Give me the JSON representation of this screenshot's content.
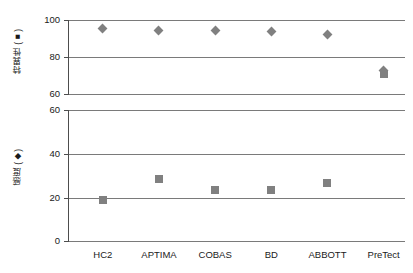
{
  "chart_data": {
    "type": "scatter",
    "title": "",
    "subtitle": "",
    "categories": [
      "HC2",
      "APTIMA",
      "COBAS",
      "BD",
      "ABBOTT",
      "PreTect"
    ],
    "panels": [
      {
        "name": "specificity-panel",
        "ylabel": "特異性 (■)",
        "ylabel_text": "特異性",
        "ylabel_marker": "square",
        "ylim": [
          60,
          100
        ],
        "yticks": [
          60,
          80,
          100
        ],
        "ytick_labels": [
          "60",
          "80",
          "100"
        ],
        "marker": "diamond",
        "marker_color": "#808080",
        "values": [
          95.5,
          94.3,
          94.2,
          93.8,
          92.2,
          72.5
        ]
      },
      {
        "name": "sensitivity-panel",
        "ylabel": "感度 (◆)",
        "ylabel_text": "感度",
        "ylabel_marker": "diamond",
        "ylim": [
          0,
          60
        ],
        "yticks": [
          0,
          20,
          40,
          60
        ],
        "ytick_labels": [
          "0",
          "20",
          "40",
          "60"
        ],
        "marker": "square",
        "marker_color": "#808080",
        "values": [
          19.0,
          28.5,
          23.5,
          23.3,
          26.5,
          71.0
        ]
      }
    ],
    "xlabel": "",
    "grid": true,
    "legend": "none"
  },
  "axis": {
    "upper_title": "特異性 (■)",
    "lower_title": "感度 (◆)",
    "upper_ticks": [
      "100",
      "80",
      "60"
    ],
    "lower_ticks": [
      "60",
      "40",
      "20",
      "0"
    ]
  },
  "colors": {
    "marker": "#808080",
    "gridline": "#7a7a7a",
    "axis": "#4d4d4d",
    "text": "#1a1a1a",
    "background": "#ffffff"
  }
}
